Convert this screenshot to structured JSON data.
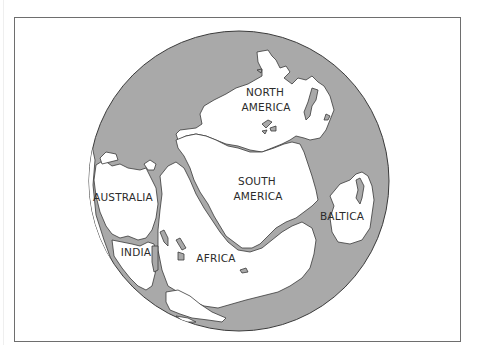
{
  "map": {
    "title": "",
    "colors": {
      "ocean": "#a9a9a9",
      "land": "#ffffff",
      "outline": "#3a3a3a",
      "frame": "#6e6e6e"
    },
    "labels": {
      "north_america": [
        "NORTH",
        "AMERICA"
      ],
      "south_america": [
        "SOUTH",
        "AMERICA"
      ],
      "australia": "AUSTRALIA",
      "india": "INDIA",
      "africa": "AFRICA",
      "baltica": "BALTICA"
    }
  }
}
